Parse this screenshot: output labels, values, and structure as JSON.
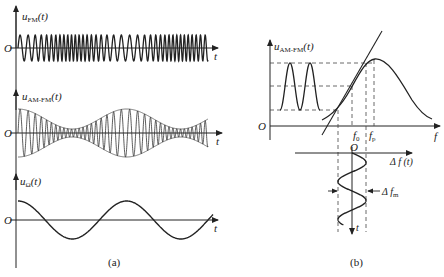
{
  "panel_a": {
    "caption": "(a)",
    "fm": {
      "label_main": "u",
      "label_sub": "FM",
      "label_arg": "(t)",
      "origin": "O",
      "x_axis": "t"
    },
    "amfm": {
      "label_main": "u",
      "label_sub": "AM-FM",
      "label_arg": "(t)",
      "origin": "O",
      "x_axis": "t"
    },
    "mod": {
      "label_main": "u",
      "label_sub": "Ω",
      "label_arg": "(t)",
      "origin": "O",
      "x_axis": "t"
    }
  },
  "panel_b": {
    "caption": "(b)",
    "y_label_main": "u",
    "y_label_sub": "AM-FM",
    "y_label_arg": "(t)",
    "origin": "O",
    "x_axis": "f",
    "f0_main": "f",
    "f0_sub": "0",
    "fp_main": "f",
    "fp_sub": "p",
    "lower_origin": "O",
    "lower_x_axis": "Δ f (t)",
    "lower_t_axis": "t",
    "deviation_main": "Δ f",
    "deviation_sub": "m"
  },
  "colors": {
    "stroke": "#222222",
    "dash": "#444444",
    "background": "#ffffff"
  }
}
